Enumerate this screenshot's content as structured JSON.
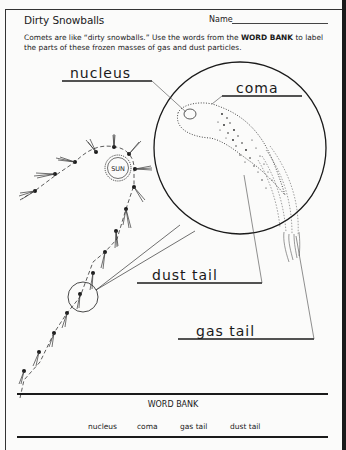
{
  "worksheet": {
    "title": "Dirty Snowballs",
    "name_label": "Name",
    "instructions_part1": "Comets are like “dirty snowballs.” Use the words from the ",
    "instructions_bold": "WORD BANK",
    "instructions_part2": " to label the parts of these frozen masses of gas and dust particles."
  },
  "diagram": {
    "sun_label": "SUN",
    "answers": {
      "nucleus": "nucleus",
      "coma": "coma",
      "dust_tail": "dust tail",
      "gas_tail": "gas tail"
    }
  },
  "word_bank": {
    "title": "WORD BANK",
    "words": [
      "nucleus",
      "coma",
      "gas tail",
      "dust tail"
    ]
  }
}
